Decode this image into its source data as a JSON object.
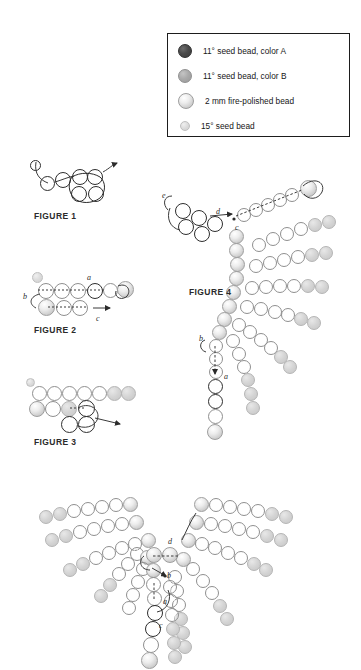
{
  "page": {
    "background": "#ffffff"
  },
  "colors": {
    "bead_color_a": "#4a4a4a",
    "bead_color_b": "#a9a9a9",
    "fire_polished": "#e8e8e8",
    "seed_15": "#dcdcdc",
    "outline": "#1d1d1d",
    "thread": "#3a3a3a"
  },
  "legend": {
    "items": [
      {
        "swatch": "bead-color-a",
        "label": "11° seed bead, color A"
      },
      {
        "swatch": "bead-color-b",
        "label": "11° seed bead, color B"
      },
      {
        "swatch": "fire-polished-bead",
        "label": "2 mm fire-polished bead"
      },
      {
        "swatch": "seed-bead-15",
        "label": "15° seed bead"
      }
    ]
  },
  "figures": [
    {
      "id": "figure-1",
      "label": "FIGURE 1",
      "tags": []
    },
    {
      "id": "figure-2",
      "label": "FIGURE 2",
      "tags": [
        "a",
        "b",
        "c"
      ]
    },
    {
      "id": "figure-3",
      "label": "FIGURE 3",
      "tags": []
    },
    {
      "id": "figure-4",
      "label": "FIGURE 4",
      "tags": [
        "a",
        "b",
        "c",
        "d",
        "e"
      ]
    },
    {
      "id": "figure-5",
      "label": "",
      "tags": [
        "a",
        "b",
        "c",
        "d"
      ]
    }
  ],
  "figure1": {
    "label": "FIGURE 1"
  },
  "figure2": {
    "label": "FIGURE 2",
    "tag_a": "a",
    "tag_b": "b",
    "tag_c": "c"
  },
  "figure3": {
    "label": "FIGURE 3"
  },
  "figure4": {
    "label": "FIGURE 4",
    "tag_a": "a",
    "tag_b": "b",
    "tag_c": "c",
    "tag_d": "d",
    "tag_e": "e"
  },
  "figure5": {
    "tag_a": "a",
    "tag_b": "b",
    "tag_c": "c",
    "tag_d": "d"
  }
}
